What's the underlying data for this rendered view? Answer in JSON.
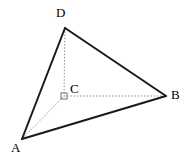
{
  "figure": {
    "type": "geometry-diagram",
    "shape": "tetrahedron",
    "width": 186,
    "height": 163,
    "background_color": "#ffffff",
    "solid_edge_color": "#1a1a1a",
    "hidden_edge_color": "#9a9a9a",
    "label_color": "#000000",
    "vertices": [
      {
        "id": "A",
        "label": "A",
        "x": 22,
        "y": 139,
        "label_x": 11,
        "label_y": 141
      },
      {
        "id": "B",
        "label": "B",
        "x": 166,
        "y": 96,
        "label_x": 171,
        "label_y": 88
      },
      {
        "id": "C",
        "label": "C",
        "x": 64,
        "y": 96,
        "label_x": 70,
        "label_y": 82
      },
      {
        "id": "D",
        "label": "D",
        "x": 65,
        "y": 28,
        "label_x": 56,
        "label_y": 6
      }
    ],
    "solid_edges": [
      {
        "from": "A",
        "to": "D"
      },
      {
        "from": "D",
        "to": "B"
      },
      {
        "from": "A",
        "to": "B"
      }
    ],
    "hidden_edges": [
      {
        "from": "D",
        "to": "C"
      },
      {
        "from": "C",
        "to": "B"
      },
      {
        "from": "A",
        "to": "C"
      }
    ],
    "right_angle_marker": {
      "at": "C",
      "x": 64,
      "y": 96,
      "size": 6
    }
  }
}
